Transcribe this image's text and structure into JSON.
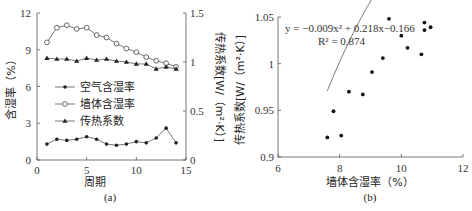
{
  "chart_data": [
    {
      "id": "a",
      "type": "line",
      "caption": "(a)",
      "xlabel": "周期",
      "ylabel": "含湿率（%）",
      "y2label": "传热系数[W/（m²·K）]",
      "xlim": [
        0,
        15
      ],
      "ylim": [
        0,
        12
      ],
      "y2lim": [
        0,
        1.5
      ],
      "xticks": [
        "0",
        "5",
        "10",
        "15"
      ],
      "yticks": [
        "0",
        "3",
        "6",
        "9",
        "12"
      ],
      "y2ticks": [
        "0",
        "0.5",
        "1",
        "1.5"
      ],
      "grid": false,
      "legend_position": "center-left",
      "x": [
        1,
        2,
        3,
        4,
        5,
        6,
        7,
        8,
        9,
        10,
        11,
        12,
        13,
        14
      ],
      "series": [
        {
          "name": "空气含湿率",
          "axis": "left",
          "marker": "filled-circle",
          "values": [
            1.3,
            1.7,
            1.6,
            1.7,
            1.9,
            1.7,
            1.3,
            1.2,
            1.3,
            1.5,
            1.4,
            1.8,
            2.6,
            1.4
          ]
        },
        {
          "name": "墙体含湿率",
          "axis": "left",
          "marker": "open-circle",
          "values": [
            9.6,
            10.8,
            11.0,
            10.7,
            10.8,
            10.2,
            10.0,
            9.5,
            9.1,
            8.8,
            8.4,
            8.1,
            7.9,
            7.6
          ]
        },
        {
          "name": "传热系数",
          "axis": "right",
          "marker": "filled-triangle",
          "values": [
            1.04,
            1.03,
            1.03,
            1.01,
            1.04,
            1.02,
            1.03,
            1.01,
            1.0,
            0.98,
            0.98,
            0.93,
            0.95,
            0.93
          ]
        }
      ]
    },
    {
      "id": "b",
      "type": "scatter",
      "caption": "(b)",
      "xlabel": "墙体含湿率（%）",
      "ylabel": "传热系数[W/（m²·K）]",
      "xlim": [
        6,
        12
      ],
      "ylim": [
        0.9,
        1.05
      ],
      "xticks": [
        "6",
        "8",
        "10",
        "12"
      ],
      "yticks": [
        "0.9",
        "0.95",
        "1",
        "1.05"
      ],
      "grid": false,
      "annotation": {
        "equation": "y = −0.009x² + 0.218x−0.166",
        "r2": "R² = 0.874"
      },
      "trendline": {
        "type": "polynomial",
        "coefficients": [
          -0.009,
          0.218,
          -0.166
        ],
        "x_range": [
          7.6,
          10.9
        ]
      },
      "points": [
        {
          "x": 7.6,
          "y": 0.921
        },
        {
          "x": 7.8,
          "y": 0.949
        },
        {
          "x": 8.05,
          "y": 0.923
        },
        {
          "x": 8.3,
          "y": 0.97
        },
        {
          "x": 8.75,
          "y": 0.967
        },
        {
          "x": 9.05,
          "y": 0.991
        },
        {
          "x": 9.4,
          "y": 1.006
        },
        {
          "x": 9.6,
          "y": 1.048
        },
        {
          "x": 10.0,
          "y": 1.03
        },
        {
          "x": 10.2,
          "y": 1.017
        },
        {
          "x": 10.65,
          "y": 1.01
        },
        {
          "x": 10.75,
          "y": 1.044
        },
        {
          "x": 10.75,
          "y": 1.036
        },
        {
          "x": 10.95,
          "y": 1.039
        }
      ]
    }
  ]
}
